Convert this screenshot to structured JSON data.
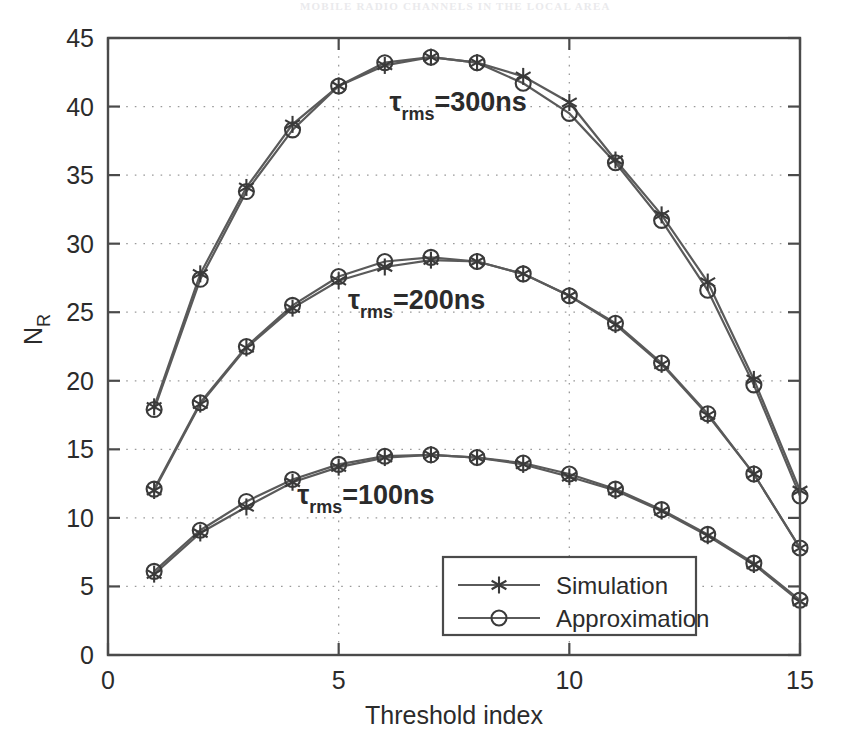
{
  "page": {
    "header_text": "MOBILE RADIO CHANNELS IN THE LOCAL AREA"
  },
  "chart_data": {
    "type": "line",
    "title": "",
    "xlabel": "Threshold index",
    "ylabel": "N_R",
    "ylabel_base": "N",
    "ylabel_sub": "R",
    "xlim": [
      0,
      15
    ],
    "ylim": [
      0,
      45
    ],
    "xticks": [
      0,
      5,
      10,
      15
    ],
    "xticklabels": [
      "0",
      "5",
      "10",
      "15"
    ],
    "yticks": [
      0,
      5,
      10,
      15,
      20,
      25,
      30,
      35,
      40,
      45
    ],
    "yticklabels": [
      "0",
      "5",
      "10",
      "15",
      "20",
      "25",
      "30",
      "35",
      "40",
      "45"
    ],
    "grid": true,
    "legend_position": "lower-center-right",
    "legend": [
      {
        "label": "Simulation",
        "marker": "asterisk"
      },
      {
        "label": "Approximation",
        "marker": "circle"
      }
    ],
    "x": [
      1,
      2,
      3,
      4,
      5,
      6,
      7,
      8,
      9,
      10,
      11,
      12,
      13,
      14,
      15
    ],
    "annotations": [
      {
        "id": "tau-300",
        "base": "τ",
        "sub": "rms",
        "rest": "=300ns",
        "x": 6.1,
        "y": 39.7
      },
      {
        "id": "tau-200",
        "base": "τ",
        "sub": "rms",
        "rest": "=200ns",
        "x": 5.2,
        "y": 25.2
      },
      {
        "id": "tau-100",
        "base": "τ",
        "sub": "rms",
        "rest": "=100ns",
        "x": 4.1,
        "y": 11.0
      }
    ],
    "groups": [
      {
        "name": "tau_rms = 300ns",
        "series": [
          {
            "name": "Simulation",
            "marker": "asterisk",
            "values": [
              18.1,
              27.8,
              34.1,
              38.7,
              41.5,
              43.0,
              43.6,
              43.2,
              42.2,
              40.3,
              36.1,
              32.1,
              27.2,
              20.1,
              12.0
            ]
          },
          {
            "name": "Approximation",
            "marker": "circle",
            "values": [
              17.9,
              27.4,
              33.8,
              38.3,
              41.5,
              43.2,
              43.6,
              43.2,
              41.7,
              39.5,
              35.9,
              31.7,
              26.6,
              19.7,
              11.6
            ]
          }
        ]
      },
      {
        "name": "tau_rms = 200ns",
        "series": [
          {
            "name": "Simulation",
            "marker": "asterisk",
            "values": [
              12.0,
              18.3,
              22.4,
              25.3,
              27.3,
              28.3,
              28.8,
              28.7,
              27.8,
              26.2,
              24.1,
              21.2,
              17.5,
              13.2,
              7.8
            ]
          },
          {
            "name": "Approximation",
            "marker": "circle",
            "values": [
              12.1,
              18.4,
              22.5,
              25.5,
              27.6,
              28.7,
              29.0,
              28.7,
              27.8,
              26.2,
              24.2,
              21.3,
              17.6,
              13.2,
              7.8
            ]
          }
        ]
      },
      {
        "name": "tau_rms = 100ns",
        "series": [
          {
            "name": "Simulation",
            "marker": "asterisk",
            "values": [
              5.9,
              8.9,
              10.8,
              12.6,
              13.7,
              14.4,
              14.6,
              14.4,
              13.9,
              13.0,
              12.0,
              10.5,
              8.7,
              6.6,
              3.9
            ]
          },
          {
            "name": "Approximation",
            "marker": "circle",
            "values": [
              6.1,
              9.1,
              11.2,
              12.8,
              13.9,
              14.5,
              14.6,
              14.4,
              14.0,
              13.2,
              12.1,
              10.6,
              8.8,
              6.7,
              4.0
            ]
          }
        ]
      }
    ]
  }
}
